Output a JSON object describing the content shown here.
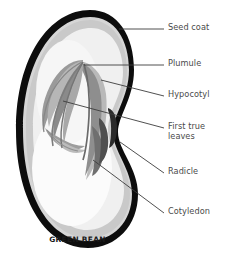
{
  "diagram": {
    "caption": "GREEN BEAN",
    "background_color": "#ffffff",
    "label_color": "#4a4a4a",
    "caption_color": "#1a1a1a",
    "leader_line_color": "#3c3c3c",
    "colors": {
      "seed_coat": "#0d0d0d",
      "outer_highlight": "#d3d3d3",
      "cotyledon": "#c9c9c9",
      "inner_cotyledon": "#efefef",
      "inner_pale": "#f7f7f7",
      "embryo": "#8c8c8c",
      "embryo_dark": "#6e6e6e",
      "embryo_light": "#b4b4b4",
      "radicle_shadow": "#4d4d4d"
    },
    "labels": [
      {
        "id": "seed-coat",
        "text": "Seed coat",
        "text_x": 168,
        "text_y": 22,
        "leader": {
          "x1": 119,
          "y1": 29,
          "x2": 164,
          "y2": 29
        }
      },
      {
        "id": "plumule",
        "text": "Plumule",
        "text_x": 168,
        "text_y": 58,
        "leader": {
          "x1": 84,
          "y1": 65,
          "x2": 164,
          "y2": 65
        }
      },
      {
        "id": "hypocotyl",
        "text": "Hypocotyl",
        "text_x": 168,
        "text_y": 89,
        "leader": {
          "x1": 101,
          "y1": 80,
          "x2": 164,
          "y2": 96
        }
      },
      {
        "id": "first-true-leaves",
        "text": "First true\nleaves",
        "text_x": 168,
        "text_y": 121,
        "leader": {
          "x1": 63,
          "y1": 101,
          "x2": 164,
          "y2": 128
        }
      },
      {
        "id": "radicle",
        "text": "Radicle",
        "text_x": 168,
        "text_y": 166,
        "leader": {
          "x1": 120,
          "y1": 142,
          "x2": 164,
          "y2": 173
        }
      },
      {
        "id": "cotyledon",
        "text": "Cotyledon",
        "text_x": 168,
        "text_y": 206,
        "leader": {
          "x1": 93,
          "y1": 160,
          "x2": 164,
          "y2": 213
        }
      }
    ],
    "parts": [
      {
        "id": "seed-coat",
        "name": "Seed coat"
      },
      {
        "id": "plumule",
        "name": "Plumule"
      },
      {
        "id": "hypocotyl",
        "name": "Hypocotyl"
      },
      {
        "id": "first-true-leaves",
        "name": "First true leaves"
      },
      {
        "id": "radicle",
        "name": "Radicle"
      },
      {
        "id": "cotyledon",
        "name": "Cotyledon"
      }
    ]
  }
}
